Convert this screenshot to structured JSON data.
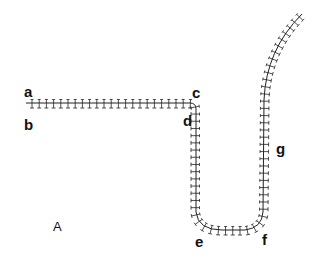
{
  "figure": {
    "panel_label": "A",
    "point_labels": {
      "a": "a",
      "b": "b",
      "c": "c",
      "d": "d",
      "e": "e",
      "f": "f",
      "g": "g"
    },
    "colors": {
      "line": "#222222",
      "background": "#ffffff"
    },
    "path": {
      "description": "chain backbone with tick-mark subunits",
      "segments": [
        {
          "from": "a/b",
          "to": "c/d",
          "shape": "horizontal"
        },
        {
          "from": "c/d",
          "to": "e",
          "shape": "vertical-down"
        },
        {
          "from": "e",
          "to": "f",
          "shape": "u-bend"
        },
        {
          "from": "f",
          "to": "g",
          "shape": "vertical-up"
        },
        {
          "from": "g",
          "to": "top-right",
          "shape": "curve"
        }
      ]
    }
  }
}
